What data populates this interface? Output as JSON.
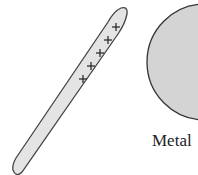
{
  "diagram": {
    "type": "electrostatic induction",
    "rod": {
      "charge_symbols": [
        "+",
        "+",
        "+",
        "+",
        "+"
      ],
      "fill": "#e4e4e4",
      "stroke": "#444444"
    },
    "sphere": {
      "label": "Metal",
      "fill": "#d4d4d4",
      "stroke": "#333333"
    }
  }
}
